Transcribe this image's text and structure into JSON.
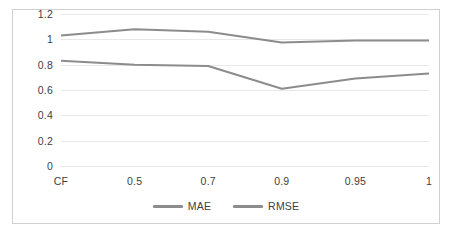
{
  "chart_data": {
    "type": "line",
    "title": "",
    "subtitle": "",
    "xlabel": "",
    "ylabel": "",
    "categories": [
      "CF",
      "0.5",
      "0.7",
      "0.9",
      "0.95",
      "1"
    ],
    "series": [
      {
        "name": "MAE",
        "values": [
          0.83,
          0.8,
          0.79,
          0.61,
          0.69,
          0.73
        ],
        "color": "#8c8c8c"
      },
      {
        "name": "RMSE",
        "values": [
          1.03,
          1.08,
          1.06,
          0.975,
          0.99,
          0.99
        ],
        "color": "#8c8c8c"
      }
    ],
    "ylim": [
      0,
      1.2
    ],
    "yticks": [
      "1.2",
      "1",
      "0.8",
      "0.6",
      "0.4",
      "0.2",
      "0"
    ],
    "ytick_values": [
      1.2,
      1,
      0.8,
      0.6,
      0.4,
      0.2,
      0
    ],
    "grid": true,
    "grid_color": "#e8e8e8",
    "legend_position": "bottom",
    "border_color": "#d0d0d0",
    "background": "#ffffff",
    "text_color": "#404040"
  }
}
